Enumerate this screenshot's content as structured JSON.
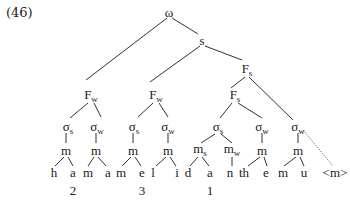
{
  "example_number": "(46)",
  "colors": {
    "line": "#1a1a1a",
    "text": "#1a1a1a",
    "background": "#ffffff"
  },
  "nodes": [
    {
      "id": "omega",
      "label": "ω",
      "sub": "",
      "x": 169,
      "y": 12,
      "level": "prosodic-word"
    },
    {
      "id": "s",
      "label": "s",
      "sub": "",
      "x": 202,
      "y": 40,
      "level": "stem"
    },
    {
      "id": "Fs_top",
      "label": "F",
      "sub": "s",
      "x": 247,
      "y": 70,
      "level": "foot"
    },
    {
      "id": "Fw1",
      "label": "F",
      "sub": "w",
      "x": 91,
      "y": 96,
      "level": "foot"
    },
    {
      "id": "Fw2",
      "label": "F",
      "sub": "w",
      "x": 156,
      "y": 96,
      "level": "foot"
    },
    {
      "id": "Fs_inner",
      "label": "F",
      "sub": "s",
      "x": 235,
      "y": 96,
      "level": "foot"
    },
    {
      "id": "sig1",
      "label": "σ",
      "sub": "s",
      "x": 68,
      "y": 128,
      "level": "syllable"
    },
    {
      "id": "sig2",
      "label": "σ",
      "sub": "w",
      "x": 97,
      "y": 128,
      "level": "syllable"
    },
    {
      "id": "sig3",
      "label": "σ",
      "sub": "s",
      "x": 134,
      "y": 128,
      "level": "syllable"
    },
    {
      "id": "sig4",
      "label": "σ",
      "sub": "w",
      "x": 168,
      "y": 128,
      "level": "syllable"
    },
    {
      "id": "sig5",
      "label": "σ",
      "sub": "s",
      "x": 218,
      "y": 128,
      "level": "syllable"
    },
    {
      "id": "sig6",
      "label": "σ",
      "sub": "w",
      "x": 262,
      "y": 128,
      "level": "syllable"
    },
    {
      "id": "sig7",
      "label": "σ",
      "sub": "w",
      "x": 298,
      "y": 128,
      "level": "syllable"
    },
    {
      "id": "m1",
      "label": "m",
      "sub": "",
      "x": 66,
      "y": 150,
      "level": "mora"
    },
    {
      "id": "m2",
      "label": "m",
      "sub": "",
      "x": 96,
      "y": 150,
      "level": "mora"
    },
    {
      "id": "m3",
      "label": "m",
      "sub": "",
      "x": 133,
      "y": 150,
      "level": "mora"
    },
    {
      "id": "m4",
      "label": "m",
      "sub": "",
      "x": 168,
      "y": 150,
      "level": "mora"
    },
    {
      "id": "m5",
      "label": "m",
      "sub": "s",
      "x": 200,
      "y": 150,
      "level": "mora"
    },
    {
      "id": "m6",
      "label": "m",
      "sub": "w",
      "x": 232,
      "y": 150,
      "level": "mora"
    },
    {
      "id": "m7",
      "label": "m",
      "sub": "",
      "x": 262,
      "y": 150,
      "level": "mora"
    },
    {
      "id": "m8",
      "label": "m",
      "sub": "",
      "x": 298,
      "y": 150,
      "level": "mora"
    },
    {
      "id": "seg_h",
      "label": "h",
      "sub": "",
      "x": 54,
      "y": 172,
      "level": "segment"
    },
    {
      "id": "seg_a1",
      "label": "a",
      "sub": "",
      "x": 73,
      "y": 172,
      "level": "segment"
    },
    {
      "id": "seg_m1",
      "label": "m",
      "sub": "",
      "x": 88,
      "y": 172,
      "level": "segment"
    },
    {
      "id": "seg_a2",
      "label": "a",
      "sub": "",
      "x": 108,
      "y": 172,
      "level": "segment"
    },
    {
      "id": "seg_m2",
      "label": "m",
      "sub": "",
      "x": 121,
      "y": 172,
      "level": "segment"
    },
    {
      "id": "seg_e1",
      "label": "e",
      "sub": "",
      "x": 142,
      "y": 172,
      "level": "segment"
    },
    {
      "id": "seg_l",
      "label": "l",
      "sub": "",
      "x": 153,
      "y": 172,
      "level": "segment"
    },
    {
      "id": "seg_i",
      "label": "i",
      "sub": "",
      "x": 177,
      "y": 172,
      "level": "segment"
    },
    {
      "id": "seg_d",
      "label": "d",
      "sub": "",
      "x": 188,
      "y": 172,
      "level": "segment"
    },
    {
      "id": "seg_a3",
      "label": "a",
      "sub": "",
      "x": 210,
      "y": 172,
      "level": "segment"
    },
    {
      "id": "seg_n",
      "label": "n",
      "sub": "",
      "x": 230,
      "y": 172,
      "level": "segment"
    },
    {
      "id": "seg_th",
      "label": "th",
      "sub": "",
      "x": 244,
      "y": 172,
      "level": "segment"
    },
    {
      "id": "seg_e2",
      "label": "e",
      "sub": "",
      "x": 266,
      "y": 172,
      "level": "segment"
    },
    {
      "id": "seg_m3",
      "label": "m",
      "sub": "",
      "x": 283,
      "y": 172,
      "level": "segment"
    },
    {
      "id": "seg_u",
      "label": "u",
      "sub": "",
      "x": 304,
      "y": 172,
      "level": "segment"
    },
    {
      "id": "seg_extra",
      "label": "<m>",
      "sub": "",
      "x": 335,
      "y": 172,
      "level": "segment"
    },
    {
      "id": "tone2",
      "label": "2",
      "sub": "",
      "x": 73,
      "y": 190,
      "level": "annotation"
    },
    {
      "id": "tone3",
      "label": "3",
      "sub": "",
      "x": 142,
      "y": 190,
      "level": "annotation"
    },
    {
      "id": "tone1",
      "label": "1",
      "sub": "",
      "x": 210,
      "y": 190,
      "level": "annotation"
    }
  ],
  "edges": [
    {
      "from": [
        167,
        18
      ],
      "to": [
        86,
        80
      ]
    },
    {
      "from": [
        172,
        18
      ],
      "to": [
        198,
        34
      ]
    },
    {
      "from": [
        200,
        46
      ],
      "to": [
        150,
        82
      ]
    },
    {
      "from": [
        205,
        46
      ],
      "to": [
        242,
        60
      ]
    },
    {
      "from": [
        245,
        77
      ],
      "to": [
        231,
        88
      ]
    },
    {
      "from": [
        249,
        77
      ],
      "to": [
        293,
        120
      ]
    },
    {
      "from": [
        88,
        103
      ],
      "to": [
        70,
        118
      ]
    },
    {
      "from": [
        94,
        103
      ],
      "to": [
        101,
        117
      ]
    },
    {
      "from": [
        153,
        103
      ],
      "to": [
        138,
        117
      ]
    },
    {
      "from": [
        159,
        103
      ],
      "to": [
        168,
        117
      ]
    },
    {
      "from": [
        232,
        103
      ],
      "to": [
        220,
        118
      ]
    },
    {
      "from": [
        238,
        103
      ],
      "to": [
        262,
        118
      ]
    },
    {
      "from": [
        66,
        133
      ],
      "to": [
        66,
        143
      ]
    },
    {
      "from": [
        96,
        133
      ],
      "to": [
        96,
        143
      ]
    },
    {
      "from": [
        133,
        133
      ],
      "to": [
        133,
        143
      ]
    },
    {
      "from": [
        168,
        133
      ],
      "to": [
        168,
        143
      ]
    },
    {
      "from": [
        215,
        134
      ],
      "to": [
        201,
        143
      ]
    },
    {
      "from": [
        221,
        134
      ],
      "to": [
        232,
        143
      ]
    },
    {
      "from": [
        262,
        133
      ],
      "to": [
        262,
        143
      ]
    },
    {
      "from": [
        298,
        133
      ],
      "to": [
        298,
        143
      ]
    },
    {
      "from": [
        64,
        157
      ],
      "to": [
        55,
        166
      ]
    },
    {
      "from": [
        68,
        157
      ],
      "to": [
        73,
        166
      ]
    },
    {
      "from": [
        94,
        157
      ],
      "to": [
        88,
        166
      ]
    },
    {
      "from": [
        98,
        157
      ],
      "to": [
        106,
        166
      ]
    },
    {
      "from": [
        131,
        157
      ],
      "to": [
        122,
        166
      ]
    },
    {
      "from": [
        135,
        157
      ],
      "to": [
        141,
        166
      ]
    },
    {
      "from": [
        166,
        157
      ],
      "to": [
        156,
        166
      ]
    },
    {
      "from": [
        170,
        157
      ],
      "to": [
        176,
        166
      ]
    },
    {
      "from": [
        198,
        157
      ],
      "to": [
        190,
        166
      ]
    },
    {
      "from": [
        202,
        157
      ],
      "to": [
        209,
        166
      ]
    },
    {
      "from": [
        232,
        157
      ],
      "to": [
        232,
        166
      ]
    },
    {
      "from": [
        260,
        157
      ],
      "to": [
        248,
        166
      ]
    },
    {
      "from": [
        264,
        157
      ],
      "to": [
        267,
        166
      ]
    },
    {
      "from": [
        296,
        157
      ],
      "to": [
        284,
        166
      ]
    },
    {
      "from": [
        300,
        157
      ],
      "to": [
        304,
        166
      ]
    }
  ],
  "dotted_edges": [
    {
      "from": [
        303,
        130
      ],
      "to": [
        333,
        166
      ]
    }
  ]
}
